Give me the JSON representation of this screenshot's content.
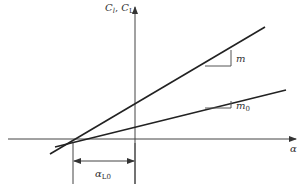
{
  "diagram": {
    "type": "lift-curve-slopes",
    "colors": {
      "line": "#222222",
      "axis": "#444444",
      "text": "#333333",
      "background": "#ffffff"
    },
    "y_axis": {
      "label_main": "C",
      "label_sub1": "l",
      "label_sep": ", ",
      "label_main2": "C",
      "label_sub2": "L"
    },
    "x_axis": {
      "label": "α"
    },
    "lines": [
      {
        "name": "steep",
        "slope_label": "m",
        "slope_label_sub": ""
      },
      {
        "name": "shallow",
        "slope_label": "m",
        "slope_label_sub": "0"
      }
    ],
    "dimension": {
      "label_main": "α",
      "label_sub": "L0"
    }
  }
}
